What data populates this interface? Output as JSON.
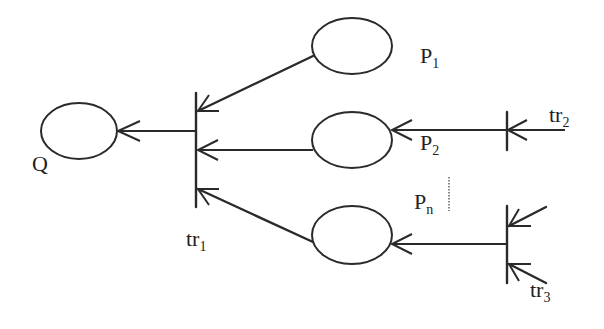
{
  "diagram": {
    "type": "petri-net-fragment",
    "nodes": {
      "Q": {
        "label": "Q",
        "kind": "place"
      },
      "P1": {
        "label": "P",
        "subscript": "1",
        "kind": "place"
      },
      "P2": {
        "label": "P",
        "subscript": "2",
        "kind": "place"
      },
      "Pn": {
        "label": "P",
        "subscript": "n",
        "kind": "place"
      },
      "tr1": {
        "label": "tr",
        "subscript": "1",
        "kind": "transition"
      },
      "tr2": {
        "label": "tr",
        "subscript": "2",
        "kind": "transition"
      },
      "tr3": {
        "label": "tr",
        "subscript": "3",
        "kind": "transition"
      }
    },
    "edges": [
      {
        "from": "tr1",
        "to": "Q"
      },
      {
        "from": "P1",
        "to": "tr1"
      },
      {
        "from": "P2",
        "to": "tr1"
      },
      {
        "from": "Pn",
        "to": "tr1"
      },
      {
        "from": "tr2",
        "to": "P2"
      },
      {
        "from": "tr3",
        "to": "Pn"
      },
      {
        "from": "external-in-tr2",
        "to": "tr2"
      },
      {
        "from": "external-in-tr3-a",
        "to": "tr3"
      },
      {
        "from": "external-in-tr3-b",
        "to": "tr3"
      }
    ],
    "ellipsis_marker": "vertical dotted line between P2 and Pn"
  }
}
